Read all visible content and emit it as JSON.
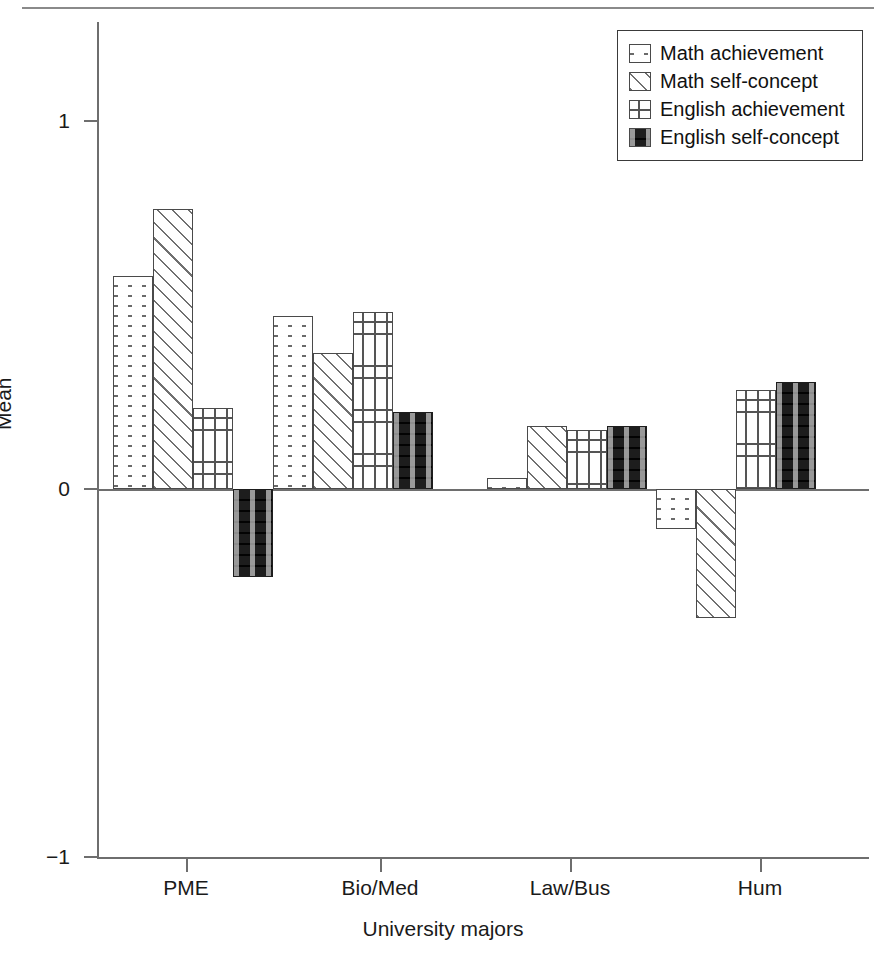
{
  "chart_data": {
    "type": "bar",
    "title": "",
    "xlabel": "University majors",
    "ylabel": "Mean",
    "categories": [
      "PME",
      "Bio/Med",
      "Law/Bus",
      "Hum"
    ],
    "series": [
      {
        "name": "Math achievement",
        "pattern": "dots",
        "values": [
          0.58,
          0.47,
          0.03,
          -0.11
        ]
      },
      {
        "name": "Math self-concept",
        "pattern": "diag",
        "values": [
          0.76,
          0.37,
          0.17,
          -0.35
        ]
      },
      {
        "name": "English achievement",
        "pattern": "plus",
        "values": [
          0.22,
          0.48,
          0.16,
          0.27
        ]
      },
      {
        "name": "English self-concept",
        "pattern": "solid",
        "values": [
          -0.24,
          0.21,
          0.17,
          0.29
        ]
      }
    ],
    "ylim": [
      -1,
      1
    ],
    "yticks": [
      1,
      0,
      -1
    ],
    "ytick_labels": [
      "1",
      "0",
      "−1"
    ],
    "grid": false,
    "legend_position": "top-right",
    "colors": {
      "outline": "#4a4a4a",
      "axis": "#6e6e6e",
      "solid_fill": "#1d1d1d"
    }
  },
  "legend": {
    "items": [
      {
        "label": "Math achievement"
      },
      {
        "label": "Math self-concept"
      },
      {
        "label": "English achievement"
      },
      {
        "label": "English self-concept"
      }
    ]
  }
}
